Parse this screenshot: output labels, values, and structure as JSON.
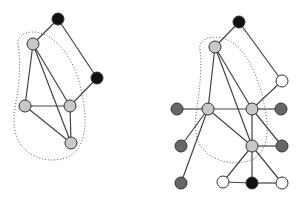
{
  "colors": {
    "black": "#111111",
    "light_gray": "#c8c8c8",
    "dark_gray": "#666666",
    "white": "#ffffff",
    "edge": "#444444",
    "outline": "#777777"
  },
  "graphs": [
    {
      "name": "left-graph",
      "node_radius": 6,
      "outline_path": "M 18 44 C 16 34, 30 30, 40 33 C 58 38, 74 60, 80 85 C 86 110, 90 140, 72 155 C 54 165, 28 160, 18 140 C 10 122, 16 105, 18 90 C 20 76, 20 56, 18 44 Z",
      "nodes": [
        {
          "id": "a",
          "x": 58,
          "y": 19,
          "fill": "black"
        },
        {
          "id": "b",
          "x": 33,
          "y": 44,
          "fill": "light_gray"
        },
        {
          "id": "c",
          "x": 97,
          "y": 78,
          "fill": "black"
        },
        {
          "id": "d",
          "x": 25,
          "y": 106,
          "fill": "light_gray"
        },
        {
          "id": "e",
          "x": 70,
          "y": 106,
          "fill": "light_gray"
        },
        {
          "id": "f",
          "x": 71,
          "y": 143,
          "fill": "light_gray"
        }
      ],
      "edges": [
        [
          "a",
          "b"
        ],
        [
          "a",
          "c"
        ],
        [
          "c",
          "e"
        ],
        [
          "b",
          "d"
        ],
        [
          "b",
          "e"
        ],
        [
          "b",
          "f"
        ],
        [
          "d",
          "e"
        ],
        [
          "d",
          "f"
        ],
        [
          "e",
          "f"
        ]
      ]
    },
    {
      "name": "right-graph",
      "node_radius": 6,
      "outline_path": "M 200 50 C 198 40, 210 35, 222 38 C 242 42, 256 70, 262 95 C 268 120, 272 145, 255 158 C 238 168, 210 162, 200 145 C 192 130, 196 115, 198 100 C 200 86, 202 62, 200 50 Z",
      "nodes": [
        {
          "id": "A",
          "x": 239,
          "y": 22,
          "fill": "black"
        },
        {
          "id": "B",
          "x": 215,
          "y": 47,
          "fill": "light_gray"
        },
        {
          "id": "C",
          "x": 282,
          "y": 81,
          "fill": "white"
        },
        {
          "id": "D",
          "x": 177,
          "y": 109,
          "fill": "dark_gray"
        },
        {
          "id": "E",
          "x": 208,
          "y": 109,
          "fill": "light_gray"
        },
        {
          "id": "F",
          "x": 252,
          "y": 109,
          "fill": "light_gray"
        },
        {
          "id": "G",
          "x": 281,
          "y": 109,
          "fill": "dark_gray"
        },
        {
          "id": "H",
          "x": 181,
          "y": 146,
          "fill": "dark_gray"
        },
        {
          "id": "I",
          "x": 252,
          "y": 146,
          "fill": "light_gray"
        },
        {
          "id": "J",
          "x": 282,
          "y": 146,
          "fill": "dark_gray"
        },
        {
          "id": "K",
          "x": 181,
          "y": 183,
          "fill": "dark_gray"
        },
        {
          "id": "L",
          "x": 223,
          "y": 182,
          "fill": "white"
        },
        {
          "id": "M",
          "x": 252,
          "y": 183,
          "fill": "black"
        },
        {
          "id": "N",
          "x": 282,
          "y": 183,
          "fill": "white"
        }
      ],
      "edges": [
        [
          "A",
          "B"
        ],
        [
          "A",
          "C"
        ],
        [
          "C",
          "F"
        ],
        [
          "B",
          "E"
        ],
        [
          "B",
          "F"
        ],
        [
          "B",
          "I"
        ],
        [
          "D",
          "E"
        ],
        [
          "E",
          "F"
        ],
        [
          "E",
          "H"
        ],
        [
          "E",
          "K"
        ],
        [
          "E",
          "I"
        ],
        [
          "F",
          "G"
        ],
        [
          "F",
          "I"
        ],
        [
          "F",
          "J"
        ],
        [
          "I",
          "J"
        ],
        [
          "I",
          "L"
        ],
        [
          "I",
          "M"
        ],
        [
          "I",
          "N"
        ],
        [
          "L",
          "M"
        ],
        [
          "M",
          "N"
        ]
      ]
    }
  ]
}
